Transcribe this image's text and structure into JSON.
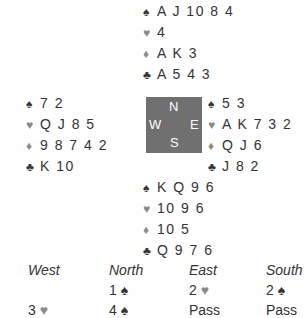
{
  "hands": {
    "north": {
      "spades": "A J 10 8 4",
      "hearts": "4",
      "diamonds": "A K 3",
      "clubs": "A 5 4 3"
    },
    "west": {
      "spades": "7 2",
      "hearts": "Q J 8 5",
      "diamonds": "9 8 7 4 2",
      "clubs": "K 10"
    },
    "east": {
      "spades": "5 3",
      "hearts": "A K 7 3 2",
      "diamonds": "Q J 6",
      "clubs": "J 8 2"
    },
    "south": {
      "spades": "K Q 9 6",
      "hearts": "10 9 6",
      "diamonds": "10 5",
      "clubs": "Q 9 7 6"
    }
  },
  "symbols": {
    "spade": "♠",
    "heart": "♥",
    "diamond": "♦",
    "club": "♣"
  },
  "compass": {
    "n": "N",
    "s": "S",
    "w": "W",
    "e": "E"
  },
  "auction": {
    "headers": [
      "West",
      "North",
      "East",
      "South"
    ],
    "rows": [
      [
        {
          "t": "",
          "s": ""
        },
        {
          "t": "1 ",
          "s": "♠"
        },
        {
          "t": "2 ",
          "s": "♥"
        },
        {
          "t": "2 ",
          "s": "♠"
        }
      ],
      [
        {
          "t": "3 ",
          "s": "♥"
        },
        {
          "t": "4 ",
          "s": "♠"
        },
        {
          "t": "Pass",
          "s": ""
        },
        {
          "t": "Pass",
          "s": ""
        }
      ]
    ]
  },
  "colors": {
    "compass_bg": "#707070",
    "red_suit": "#8a8a8a",
    "text": "#333333"
  }
}
